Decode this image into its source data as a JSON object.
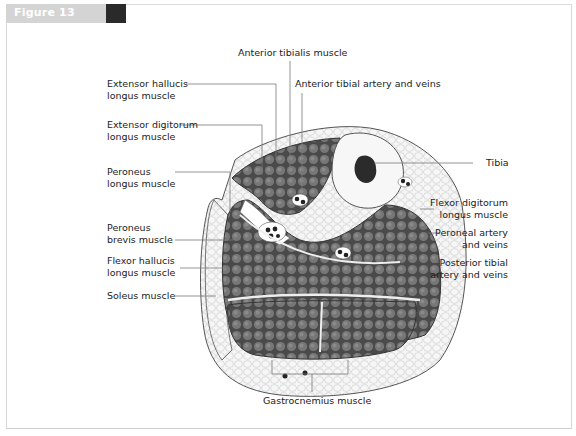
{
  "figure": {
    "label": "Figure 13",
    "tab_color": "#d4d4d4",
    "block_color": "#2a2a2a"
  },
  "diagram": {
    "labels": {
      "anterior_tibialis": "Anterior tibialis muscle",
      "anterior_tibial_artery": "Anterior tibial artery and veins",
      "extensor_hallucis_1": "Extensor hallucis",
      "extensor_hallucis_2": "longus muscle",
      "extensor_digitorum_1": "Extensor digitorum",
      "extensor_digitorum_2": "longus muscle",
      "peroneus_longus_1": "Peroneus",
      "peroneus_longus_2": "longus muscle",
      "peroneus_brevis_1": "Peroneus",
      "peroneus_brevis_2": "brevis muscle",
      "flexor_hallucis_1": "Flexor hallucis",
      "flexor_hallucis_2": "longus muscle",
      "soleus": "Soleus muscle",
      "tibia": "Tibia",
      "flexor_digitorum_1": "Flexor digitorum",
      "flexor_digitorum_2": "longus muscle",
      "peroneal_artery_1": "Peroneal artery",
      "peroneal_artery_2": "and veins",
      "posterior_tibial_1": "Posterior tibial",
      "posterior_tibial_2": "artery and veins",
      "gastrocnemius": "Gastrocnemius muscle"
    },
    "colors": {
      "muscle": "#6e6e6e",
      "muscle_outline": "#3a3a3a",
      "fat": "#f4f4f4",
      "bone": "#f7f7f7",
      "marrow": "#2b2b2b",
      "leader_line": "#7a7a7a"
    }
  }
}
